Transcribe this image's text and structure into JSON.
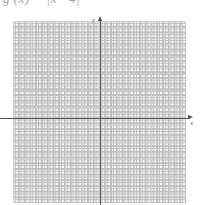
{
  "page": {
    "background_color": "#ffffff",
    "width": 203,
    "height": 205
  },
  "formula": {
    "text": "g (x) = |x - 4|",
    "note": "clipped at top edge of image",
    "color": "#5a5a5a"
  },
  "axes": {
    "x_label": "x",
    "y_label": "y",
    "axis_color": "#585858",
    "arrow_color": "#4e4e4e"
  },
  "grid": {
    "minor_color": "#b4b4b4",
    "major_color": "#cfcfcf",
    "minor_spacing_px": 5.77,
    "major_spacing_px": 17.3
  },
  "chart_data": {
    "type": "line",
    "title": "",
    "subtitle": "",
    "xlabel": "x",
    "ylabel": "y",
    "xlim": [
      -5,
      5
    ],
    "ylim": [
      -5,
      5
    ],
    "grid": true,
    "legend": null,
    "series": [],
    "x": [],
    "values": [],
    "annotations": [
      {
        "text": "g (x) = |x - 4|",
        "position": "top-left"
      }
    ]
  }
}
